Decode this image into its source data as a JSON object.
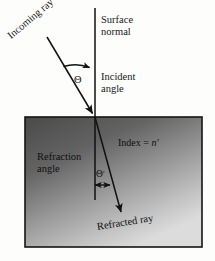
{
  "figure": {
    "type": "optics-refraction-diagram",
    "title_text": null,
    "labels": {
      "incoming_ray": "Incoming ray",
      "surface_normal_line1": "Surface",
      "surface_normal_line2": "normal",
      "incident_angle_line1": "Incident",
      "incident_angle_line2": "angle",
      "theta": "Θ",
      "theta_prime_symbol": "Θ",
      "theta_prime_mark": "′",
      "index_prefix": "Index = ",
      "index_symbol": "n",
      "index_prime": "′",
      "refraction_angle_line1": "Refraction",
      "refraction_angle_line2": "angle",
      "refracted_ray": "Refracted ray"
    },
    "colors": {
      "page_background": "#fdfdfc",
      "medium_dark": "#4c4c4c",
      "medium_light": "#d5d5d5",
      "line": "#111111",
      "text": "#17171a",
      "border": "#1a1a1a"
    },
    "geometry": {
      "medium_rect": {
        "x": 25,
        "y": 117,
        "width": 177,
        "height": 130
      },
      "normal_line": {
        "x": 95,
        "y1": 8,
        "y2": 200
      },
      "incidence_point": {
        "x": 95,
        "y": 117
      },
      "incoming_ray": {
        "x1": 47,
        "y1": 37,
        "x2": 95,
        "y2": 117
      },
      "refracted_ray": {
        "x1": 95,
        "y1": 117,
        "x2": 123,
        "y2": 216
      },
      "incident_arc": {
        "radius": 40
      },
      "refraction_arrow": {
        "x1": 93,
        "y1": 185,
        "x2": 112,
        "y2": 185
      }
    }
  }
}
